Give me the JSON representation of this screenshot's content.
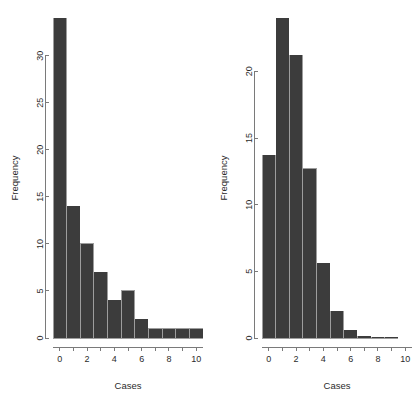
{
  "figure": {
    "background_color": "#ffffff",
    "bar_color": "#3c3c3c",
    "bar_edge_color": "#ffffff",
    "axis_color": "#7a7a7a",
    "text_color": "#2b2b2b",
    "panel_count": 2
  },
  "chart_data": [
    {
      "type": "bar",
      "panel": "left",
      "title": "",
      "xlabel": "Cases",
      "ylabel": "Frequency",
      "categories": [
        "0",
        "1",
        "2",
        "3",
        "4",
        "5",
        "6",
        "7",
        "8",
        "9",
        "10"
      ],
      "values": [
        34,
        14,
        10,
        7,
        4,
        5,
        2,
        1,
        1,
        1,
        1
      ],
      "xlim": [
        -0.5,
        10.5
      ],
      "ylim": [
        0,
        34
      ],
      "yticks": [
        0,
        5,
        10,
        15,
        20,
        25,
        30
      ],
      "ytick_labels": [
        "0",
        "5",
        "10",
        "15",
        "20",
        "25",
        "30"
      ],
      "xticks": [
        0,
        1,
        2,
        3,
        4,
        5,
        6,
        7,
        8,
        9,
        10
      ],
      "xtick_labels": [
        "0",
        "",
        "2",
        "",
        "4",
        "",
        "6",
        "",
        "8",
        "",
        "10"
      ],
      "grid": false,
      "legend": "none"
    },
    {
      "type": "bar",
      "panel": "right",
      "title": "",
      "xlabel": "Cases",
      "ylabel": "Frequency",
      "categories": [
        "0",
        "1",
        "2",
        "3",
        "4",
        "5",
        "6",
        "7",
        "8",
        "9",
        "10"
      ],
      "values": [
        13.7,
        24.0,
        21.2,
        12.7,
        5.6,
        2.0,
        0.6,
        0.15,
        0.05,
        0.02,
        0.0
      ],
      "xlim": [
        -0.5,
        10.5
      ],
      "ylim": [
        0,
        24
      ],
      "yticks": [
        0,
        5,
        10,
        15,
        20
      ],
      "ytick_labels": [
        "0",
        "5",
        "10",
        "15",
        "20"
      ],
      "xticks": [
        0,
        1,
        2,
        3,
        4,
        5,
        6,
        7,
        8,
        9,
        10
      ],
      "xtick_labels": [
        "0",
        "",
        "2",
        "",
        "4",
        "",
        "6",
        "",
        "8",
        "",
        "10"
      ],
      "grid": false,
      "legend": "none"
    }
  ]
}
